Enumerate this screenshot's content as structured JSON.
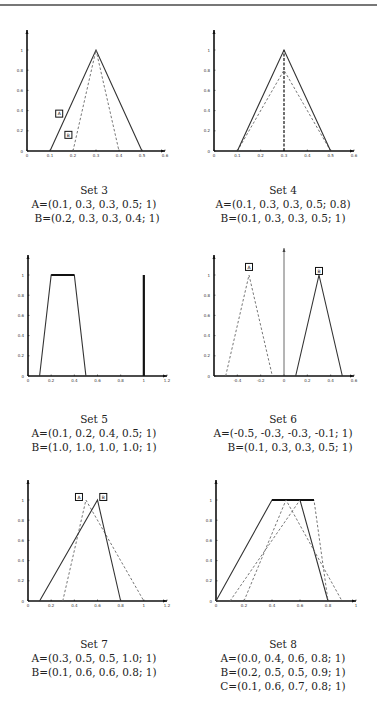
{
  "chart_data": [
    {
      "type": "line",
      "title": "Set 3",
      "xlim": [
        0,
        0.6
      ],
      "ylim": [
        0,
        1.2
      ],
      "xticks": [
        "0",
        "0.1",
        "0.2",
        "0.3",
        "0.4",
        "0.5",
        "0.6"
      ],
      "yticks": [
        "0",
        "0.2",
        "0.4",
        "0.6",
        "0.8",
        "1"
      ],
      "series": [
        {
          "name": "A",
          "style": "solid",
          "params": [
            0.1,
            0.3,
            0.3,
            0.5,
            1
          ]
        },
        {
          "name": "B",
          "style": "dashed",
          "params": [
            0.2,
            0.3,
            0.3,
            0.4,
            1
          ]
        }
      ],
      "annotations": [
        "A",
        "B"
      ],
      "captions": [
        "A=(0.1, 0.3, 0.3, 0.5; 1)",
        "B=(0.2, 0.3, 0.3, 0.4; 1)"
      ]
    },
    {
      "type": "line",
      "title": "Set 4",
      "xlim": [
        0,
        0.6
      ],
      "ylim": [
        0,
        1.2
      ],
      "xticks": [
        "0",
        "0.1",
        "0.2",
        "0.3",
        "0.4",
        "0.5",
        "0.6"
      ],
      "yticks": [
        "0",
        "0.2",
        "0.4",
        "0.6",
        "0.8",
        "1"
      ],
      "series": [
        {
          "name": "A",
          "style": "dashed",
          "params": [
            0.1,
            0.3,
            0.3,
            0.5,
            0.8
          ]
        },
        {
          "name": "B",
          "style": "solid",
          "params": [
            0.1,
            0.3,
            0.3,
            0.5,
            1
          ]
        }
      ],
      "annotations": [],
      "captions": [
        "A=(0.1, 0.3, 0.3, 0.5; 0.8)",
        "B=(0.1, 0.3, 0.3, 0.5; 1)"
      ]
    },
    {
      "type": "line",
      "title": "Set 5",
      "xlim": [
        0,
        1.2
      ],
      "ylim": [
        0,
        1.2
      ],
      "xticks": [
        "0",
        "0.2",
        "0.4",
        "0.6",
        "0.8",
        "1",
        "1.2"
      ],
      "yticks": [
        "0",
        "0.2",
        "0.4",
        "0.6",
        "0.8",
        "1"
      ],
      "series": [
        {
          "name": "A",
          "style": "solid",
          "params": [
            0.1,
            0.2,
            0.4,
            0.5,
            1
          ]
        },
        {
          "name": "B",
          "style": "solid",
          "params": [
            1.0,
            1.0,
            1.0,
            1.0,
            1
          ]
        }
      ],
      "annotations": [],
      "captions": [
        "A=(0.1, 0.2, 0.4, 0.5; 1)",
        "B=(1.0, 1.0, 1.0, 1.0; 1)"
      ]
    },
    {
      "type": "line",
      "title": "Set 6",
      "xlim": [
        -0.6,
        0.6
      ],
      "ylim": [
        0,
        1.2
      ],
      "xticks": [
        "-0.4",
        "-0.2",
        "0",
        "0.2",
        "0.4",
        "0.6"
      ],
      "yticks": [
        "0",
        "0.2",
        "0.4",
        "0.6",
        "0.8",
        "1"
      ],
      "series": [
        {
          "name": "A",
          "style": "dashed",
          "params": [
            -0.5,
            -0.3,
            -0.3,
            -0.1,
            1
          ]
        },
        {
          "name": "B",
          "style": "solid",
          "params": [
            0.1,
            0.3,
            0.3,
            0.5,
            1
          ]
        }
      ],
      "annotations": [
        "A",
        "B"
      ],
      "captions": [
        "A=(-0.5, -0.3, -0.3, -0.1; 1)",
        "B=(0.1, 0.3, 0.3, 0.5; 1)"
      ]
    },
    {
      "type": "line",
      "title": "Set 7",
      "xlim": [
        0,
        1.2
      ],
      "ylim": [
        0,
        1.2
      ],
      "xticks": [
        "0",
        "0.2",
        "0.4",
        "0.6",
        "0.8",
        "1",
        "1.2"
      ],
      "yticks": [
        "0",
        "0.2",
        "0.4",
        "0.6",
        "0.8",
        "1"
      ],
      "series": [
        {
          "name": "A",
          "style": "dashed",
          "params": [
            0.3,
            0.5,
            0.5,
            1.0,
            1
          ]
        },
        {
          "name": "B",
          "style": "solid",
          "params": [
            0.1,
            0.6,
            0.6,
            0.8,
            1
          ]
        }
      ],
      "annotations": [
        "A",
        "B"
      ],
      "captions": [
        "A=(0.3, 0.5, 0.5, 1.0; 1)",
        "B=(0.1, 0.6, 0.6, 0.8; 1)"
      ]
    },
    {
      "type": "line",
      "title": "Set 8",
      "xlim": [
        0,
        1
      ],
      "ylim": [
        0,
        1.2
      ],
      "xticks": [
        "0",
        "0.2",
        "0.4",
        "0.6",
        "0.8",
        "1"
      ],
      "yticks": [
        "0",
        "0.2",
        "0.4",
        "0.6",
        "0.8",
        "1"
      ],
      "series": [
        {
          "name": "A",
          "style": "solid",
          "params": [
            0.0,
            0.4,
            0.6,
            0.8,
            1
          ]
        },
        {
          "name": "B",
          "style": "dashed",
          "params": [
            0.2,
            0.5,
            0.5,
            0.9,
            1
          ]
        },
        {
          "name": "C",
          "style": "dashed",
          "params": [
            0.1,
            0.6,
            0.7,
            0.8,
            1
          ]
        }
      ],
      "annotations": [],
      "captions": [
        "A=(0.0, 0.4, 0.6, 0.8; 1)",
        "B=(0.2, 0.5, 0.5, 0.9; 1)",
        "C=(0.1, 0.6, 0.7, 0.8; 1)"
      ]
    }
  ]
}
